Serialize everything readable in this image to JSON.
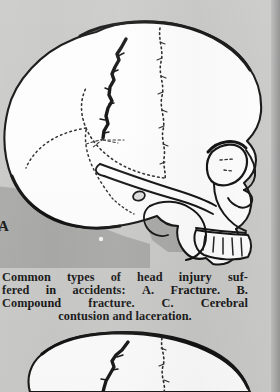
{
  "page": {
    "background_color": "#c9c9c8",
    "ink_color": "#141414",
    "bone_fill_color": "#fdfdfd",
    "shadow_fill_color": "#a8a8a6",
    "width": 280,
    "height": 392
  },
  "figure_a": {
    "name": "lateral-skull-fracture",
    "label": "A",
    "description": "Lateral view of a human skull showing a linear fracture of the cranial vault and dotted cranial suture lines"
  },
  "figure_b": {
    "name": "lateral-skull-compound-fracture",
    "description": "Top of a second lateral skull illustration showing a compound fracture"
  },
  "caption": {
    "lines": [
      {
        "words": [
          "Common",
          "types",
          "of",
          "head",
          "injury",
          "suf-"
        ],
        "align": "justify"
      },
      {
        "words": [
          "fered",
          "in",
          "accidents:",
          "A.",
          "Fracture.",
          "B."
        ],
        "align": "justify"
      },
      {
        "words": [
          "Compound",
          "fracture.",
          "C.",
          "Cerebral"
        ],
        "align": "justify"
      },
      {
        "text": "contusion and laceration.",
        "align": "center"
      }
    ],
    "full_text": "Common types of head injury suffered in accidents: A. Fracture. B. Compound fracture. C. Cerebral contusion and laceration."
  }
}
